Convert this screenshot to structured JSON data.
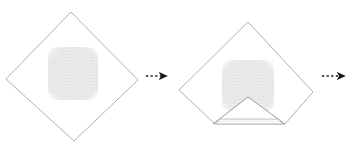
{
  "figure": {
    "background_color": "#ffffff",
    "width": 353,
    "height": 143,
    "step_count": 2,
    "outline_color": "#b0b0b5",
    "mesh_color": "#e2e2e2",
    "mesh_line_color": "#d2d2d2",
    "arrow_color": "#1a1a1a",
    "fold_band_color": "#f4f4f4"
  },
  "steps": [
    {
      "id": "step-1",
      "label": "Flat cloth with patch",
      "shape": "diamond",
      "state": "unfolded",
      "diamond": {
        "top": [
          71,
          12
        ],
        "right": [
          138,
          80
        ],
        "bottom": [
          74,
          141
        ],
        "left": [
          6,
          79
        ]
      },
      "patch": {
        "name": "mesh-patch",
        "x": 48,
        "y": 47,
        "width": 50,
        "height": 53,
        "corner_radius": 9,
        "texture": "grid-mesh"
      }
    },
    {
      "id": "step-2",
      "label": "Bottom corner folded up",
      "shape": "diamond",
      "state": "bottom-corner-folded",
      "diamond": {
        "top": [
          248,
          22
        ],
        "right": [
          313,
          92
        ],
        "bottom": [
          250,
          136
        ],
        "left": [
          179,
          90
        ]
      },
      "patch": {
        "name": "mesh-patch",
        "x": 222,
        "y": 60,
        "width": 52,
        "height": 52,
        "corner_radius": 9,
        "texture": "grid-mesh"
      },
      "fold": {
        "name": "fold-flap",
        "apex": [
          248,
          97
        ],
        "left_base": [
          213,
          124
        ],
        "right_base": [
          285,
          124
        ],
        "band_top_left": [
          220,
          119
        ],
        "band_top_right": [
          278,
          119
        ],
        "band_bottom_left": [
          215,
          124
        ],
        "band_bottom_right": [
          283,
          124
        ]
      }
    }
  ],
  "arrows": [
    {
      "id": "arrow-1",
      "name": "transition-arrow-1",
      "from_step": "step-1",
      "to_step": "step-2",
      "x1": 146,
      "y1": 76,
      "x2": 172,
      "y2": 76,
      "style": "dashed-with-solid-head"
    },
    {
      "id": "arrow-2",
      "name": "transition-arrow-2",
      "from_step": "step-2",
      "to_step": "step-3",
      "x1": 322,
      "y1": 76,
      "x2": 350,
      "y2": 76,
      "style": "dashed-with-solid-head"
    }
  ]
}
